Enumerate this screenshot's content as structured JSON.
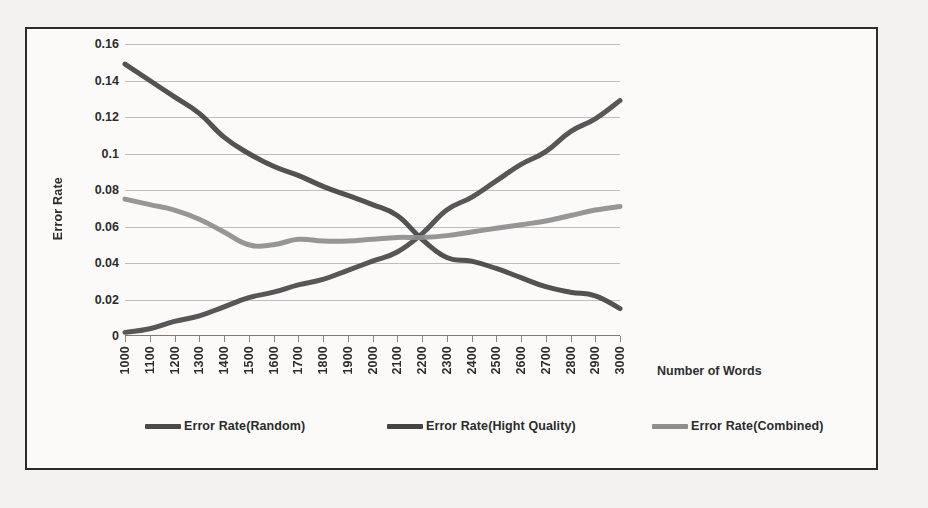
{
  "page": {
    "bleed_text": "                                                                                                                              \n                              \n                                 \n                       \n                              \n                        \n                           \n                        \n                             \n                           \n                               \n                                \n                           \n                             \n                             \n                          "
  },
  "figure": {
    "border_color": "#2b2b2b",
    "background": "#fcfbfa"
  },
  "legend": {
    "position": "bottom",
    "items": [
      {
        "label": "Error Rate(Random)",
        "color": "#4a4a4a",
        "x": 118
      },
      {
        "label": "Error Rate(Hight Quality)",
        "color": "#444444",
        "x": 360
      },
      {
        "label": "Error Rate(Combined)",
        "color": "#8e8e8e",
        "x": 625
      }
    ]
  },
  "chart_data": {
    "type": "line",
    "title": "",
    "xlabel": "Number of Words",
    "ylabel": "Error Rate",
    "xlim": [
      1000,
      3000
    ],
    "ylim": [
      0,
      0.16
    ],
    "grid": true,
    "ytick_labels": [
      "0.16",
      "0.14",
      "0.12",
      "0.1",
      "0.08",
      "0.06",
      "0.04",
      "0.02",
      "0"
    ],
    "ytick_values": [
      0.16,
      0.14,
      0.12,
      0.1,
      0.08,
      0.06,
      0.04,
      0.02,
      0
    ],
    "categories": [
      1000,
      1100,
      1200,
      1300,
      1400,
      1500,
      1600,
      1700,
      1800,
      1900,
      2000,
      2100,
      2200,
      2300,
      2400,
      2500,
      2600,
      2700,
      2800,
      2900,
      3000
    ],
    "series": [
      {
        "name": "Error Rate(Random)",
        "color": "#4a4a4a",
        "values": [
          0.002,
          0.004,
          0.008,
          0.011,
          0.016,
          0.021,
          0.024,
          0.028,
          0.031,
          0.036,
          0.041,
          0.046,
          0.056,
          0.069,
          0.076,
          0.085,
          0.094,
          0.101,
          0.112,
          0.119,
          0.129
        ]
      },
      {
        "name": "Error Rate(Hight Quality)",
        "color": "#444444",
        "values": [
          0.149,
          0.14,
          0.131,
          0.122,
          0.109,
          0.1,
          0.093,
          0.088,
          0.082,
          0.077,
          0.072,
          0.066,
          0.053,
          0.043,
          0.041,
          0.037,
          0.032,
          0.027,
          0.024,
          0.022,
          0.015
        ]
      },
      {
        "name": "Error Rate(Combined)",
        "color": "#8e8e8e",
        "values": [
          0.075,
          0.072,
          0.069,
          0.064,
          0.057,
          0.05,
          0.05,
          0.053,
          0.052,
          0.052,
          0.053,
          0.054,
          0.054,
          0.055,
          0.057,
          0.059,
          0.061,
          0.063,
          0.066,
          0.069,
          0.071
        ]
      }
    ]
  }
}
